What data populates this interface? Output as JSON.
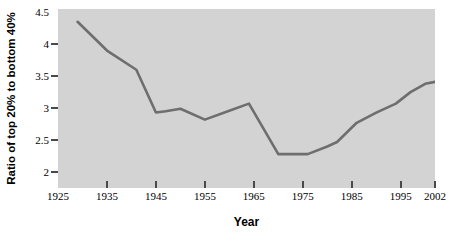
{
  "chart_data": {
    "type": "line",
    "title": "",
    "xlabel": "Year",
    "ylabel": "Ratio of top 20% to bottom 40%",
    "xlim": [
      1925,
      2002
    ],
    "ylim": [
      1.75,
      4.55
    ],
    "grid": false,
    "legend": null,
    "line_color": "#6e6e6e",
    "plot_background": "#d3d3d3",
    "page_background": "#ffffff",
    "x_ticks": [
      "1925",
      "1935",
      "1945",
      "1955",
      "1965",
      "1975",
      "1985",
      "1995",
      "2002"
    ],
    "x_tick_values": [
      1925,
      1935,
      1945,
      1955,
      1965,
      1975,
      1985,
      1995,
      2002
    ],
    "x_tick_marks_shown": [
      false,
      true,
      true,
      true,
      true,
      true,
      true,
      true,
      true
    ],
    "y_ticks": [
      "4.5",
      "4",
      "3.5",
      "3",
      "2.5",
      "2"
    ],
    "y_tick_values": [
      4.5,
      4,
      3.5,
      3,
      2.5,
      2
    ],
    "y_tick_marks_shown": [
      false,
      true,
      true,
      true,
      true,
      true
    ],
    "series": [
      {
        "name": "Ratio of top 20% to bottom 40%",
        "x": [
          1929,
          1935,
          1941,
          1945,
          1947,
          1950,
          1955,
          1959,
          1964,
          1970,
          1976,
          1980,
          1982,
          1986,
          1990,
          1994,
          1997,
          2000,
          2002
        ],
        "values": [
          4.35,
          3.9,
          3.6,
          2.93,
          2.95,
          2.99,
          2.82,
          2.93,
          3.07,
          2.28,
          2.28,
          2.4,
          2.47,
          2.77,
          2.93,
          3.07,
          3.25,
          3.38,
          3.41
        ]
      }
    ]
  }
}
